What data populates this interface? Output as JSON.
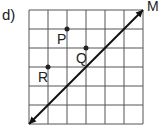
{
  "problem_label": "d)",
  "grid": {
    "cols": 6,
    "rows": 6,
    "left": 29,
    "top": 10,
    "cell": 19
  },
  "line": {
    "label": "M",
    "from": [
      0,
      6
    ],
    "to": [
      6,
      0
    ],
    "arrows": "both"
  },
  "points": [
    {
      "label": "P",
      "col": 2,
      "row": 1
    },
    {
      "label": "Q",
      "col": 3,
      "row": 2
    },
    {
      "label": "R",
      "col": 1,
      "row": 3
    }
  ]
}
